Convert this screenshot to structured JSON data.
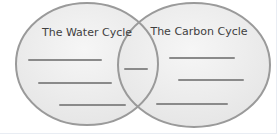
{
  "diagram": {
    "type": "venn-diagram",
    "title_left": "The Water Cycle",
    "title_right": "The Carbon Cycle",
    "left_blank_line_count": 3,
    "overlap_blank_line_count": 1,
    "right_blank_line_count": 3
  },
  "colors": {
    "background": "#ffffff",
    "circle_fill_center": "#f6f6f6",
    "circle_fill_edge": "#e2e2e2",
    "circle_outline": "#9a9a9a",
    "blank_line": "#8a8a8a",
    "title_text": "#3f3f3f"
  }
}
